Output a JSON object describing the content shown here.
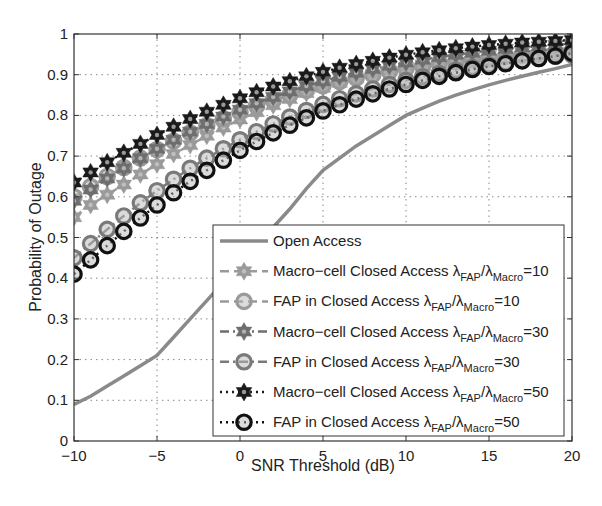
{
  "chart_data": {
    "type": "line",
    "title": "",
    "xlabel": "SNR Threshold (dB)",
    "ylabel": "Probability of Outage",
    "xlim": [
      -10,
      20
    ],
    "ylim": [
      0,
      1
    ],
    "xticks": [
      -10,
      -5,
      0,
      5,
      10,
      15,
      20
    ],
    "yticks": [
      0,
      0.1,
      0.2,
      0.3,
      0.4,
      0.5,
      0.6,
      0.7,
      0.8,
      0.9,
      1
    ],
    "xtick_labels": [
      "−10",
      "−5",
      "0",
      "5",
      "10",
      "15",
      "20"
    ],
    "ytick_labels": [
      "0",
      "0.1",
      "0.2",
      "0.3",
      "0.4",
      "0.5",
      "0.6",
      "0.7",
      "0.8",
      "0.9",
      "1"
    ],
    "grid": true,
    "legend_position": "lower right",
    "x": [
      -10,
      -9,
      -8,
      -7,
      -6,
      -5,
      -4,
      -3,
      -2,
      -1,
      0,
      1,
      2,
      3,
      4,
      5,
      6,
      7,
      8,
      9,
      10,
      11,
      12,
      13,
      14,
      15,
      16,
      17,
      18,
      19,
      20
    ],
    "series": [
      {
        "name": "Open Access",
        "legend_main": "Open Access",
        "legend_ratio": "",
        "color": "#8a8a8a",
        "line": "solid",
        "marker": "none",
        "values": [
          0.09,
          0.11,
          0.135,
          0.16,
          0.185,
          0.21,
          0.255,
          0.3,
          0.345,
          0.39,
          0.435,
          0.48,
          0.525,
          0.57,
          0.62,
          0.665,
          0.695,
          0.725,
          0.75,
          0.775,
          0.8,
          0.818,
          0.835,
          0.85,
          0.863,
          0.875,
          0.886,
          0.896,
          0.906,
          0.915,
          0.925
        ]
      },
      {
        "name": "Macro-cell Closed Access λFAP/λMacro=10",
        "legend_main": "Macro−cell Closed Access",
        "legend_ratio": "=10",
        "color": "#9a9a9a",
        "line": "dashed",
        "marker": "star",
        "values": [
          0.55,
          0.58,
          0.605,
          0.63,
          0.655,
          0.68,
          0.705,
          0.727,
          0.75,
          0.77,
          0.79,
          0.808,
          0.825,
          0.84,
          0.855,
          0.868,
          0.88,
          0.891,
          0.901,
          0.91,
          0.918,
          0.925,
          0.932,
          0.938,
          0.943,
          0.948,
          0.952,
          0.956,
          0.96,
          0.963,
          0.966
        ]
      },
      {
        "name": "FAP in Closed Access λFAP/λMacro=10",
        "legend_main": "FAP in Closed Access",
        "legend_ratio": "=10",
        "color": "#9a9a9a",
        "line": "dashed",
        "marker": "circle",
        "values": [
          0.6,
          0.625,
          0.65,
          0.672,
          0.695,
          0.716,
          0.737,
          0.757,
          0.775,
          0.792,
          0.808,
          0.823,
          0.837,
          0.85,
          0.862,
          0.873,
          0.883,
          0.892,
          0.9,
          0.908,
          0.915,
          0.921,
          0.927,
          0.932,
          0.937,
          0.941,
          0.945,
          0.948,
          0.951,
          0.953,
          0.955
        ]
      },
      {
        "name": "Macro-cell Closed Access λFAP/λMacro=30",
        "legend_main": "Macro−cell Closed Access",
        "legend_ratio": "=30",
        "color": "#6e6e6e",
        "line": "dashdot",
        "marker": "star",
        "values": [
          0.59,
          0.618,
          0.645,
          0.67,
          0.695,
          0.718,
          0.74,
          0.76,
          0.779,
          0.797,
          0.814,
          0.83,
          0.845,
          0.859,
          0.872,
          0.884,
          0.895,
          0.905,
          0.914,
          0.922,
          0.93,
          0.937,
          0.943,
          0.949,
          0.954,
          0.959,
          0.963,
          0.967,
          0.97,
          0.973,
          0.976
        ]
      },
      {
        "name": "FAP in Closed Access λFAP/λMacro=30",
        "legend_main": "FAP in Closed Access",
        "legend_ratio": "=30",
        "color": "#7a7a7a",
        "line": "dashdot",
        "marker": "circle",
        "values": [
          0.45,
          0.485,
          0.52,
          0.553,
          0.585,
          0.615,
          0.643,
          0.67,
          0.695,
          0.718,
          0.74,
          0.76,
          0.779,
          0.796,
          0.812,
          0.827,
          0.841,
          0.853,
          0.865,
          0.876,
          0.886,
          0.895,
          0.903,
          0.911,
          0.918,
          0.924,
          0.93,
          0.935,
          0.94,
          0.945,
          0.949
        ]
      },
      {
        "name": "Macro-cell Closed Access λFAP/λMacro=50",
        "legend_main": "Macro−cell Closed Access",
        "legend_ratio": "=50",
        "color": "#1a1a1a",
        "line": "dotted",
        "marker": "star",
        "values": [
          0.635,
          0.66,
          0.685,
          0.708,
          0.73,
          0.752,
          0.772,
          0.791,
          0.809,
          0.826,
          0.842,
          0.857,
          0.871,
          0.884,
          0.896,
          0.907,
          0.917,
          0.926,
          0.934,
          0.942,
          0.949,
          0.955,
          0.96,
          0.965,
          0.969,
          0.973,
          0.976,
          0.979,
          0.981,
          0.983,
          0.985
        ]
      },
      {
        "name": "FAP in Closed Access λFAP/λMacro=50",
        "legend_main": "FAP in Closed Access",
        "legend_ratio": "=50",
        "color": "#111111",
        "line": "dotted",
        "marker": "circle",
        "values": [
          0.41,
          0.445,
          0.48,
          0.515,
          0.548,
          0.58,
          0.61,
          0.638,
          0.665,
          0.69,
          0.714,
          0.736,
          0.757,
          0.776,
          0.794,
          0.811,
          0.826,
          0.84,
          0.853,
          0.865,
          0.876,
          0.886,
          0.896,
          0.905,
          0.913,
          0.92,
          0.927,
          0.934,
          0.94,
          0.946,
          0.953
        ]
      }
    ]
  },
  "legend": {
    "lambda_fap": "λ",
    "fap_sub": "FAP",
    "slash": "/",
    "lambda_macro": "λ",
    "macro_sub": "Macro"
  }
}
